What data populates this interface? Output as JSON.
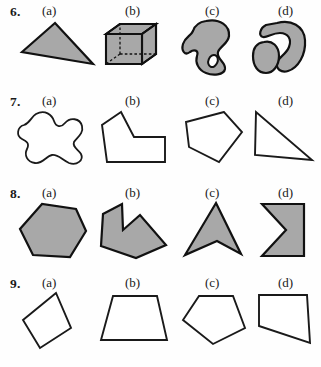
{
  "page": {
    "kind": "geometry-worksheet-figures",
    "background_color": "#fefefe",
    "fill_color": "#a8a8a8",
    "stroke_color": "#111111"
  },
  "option_labels": {
    "a": "(a)",
    "b": "(b)",
    "c": "(c)",
    "d": "(d)"
  },
  "questions": [
    {
      "number": "6.",
      "figures": [
        {
          "option": "(a)",
          "name": "shaded-obtuse-triangle",
          "style": "filled"
        },
        {
          "option": "(b)",
          "name": "wireframe-cube",
          "style": "filled-3d"
        },
        {
          "option": "(c)",
          "name": "shaded-blob-with-hole",
          "style": "filled"
        },
        {
          "option": "(d)",
          "name": "two-shaded-blobs",
          "style": "filled"
        }
      ]
    },
    {
      "number": "7.",
      "figures": [
        {
          "option": "(a)",
          "name": "curvy-closed-blob-outline",
          "style": "outline"
        },
        {
          "option": "(b)",
          "name": "l-shaped-polygon-outline",
          "style": "outline"
        },
        {
          "option": "(c)",
          "name": "pentagon-outline",
          "style": "outline"
        },
        {
          "option": "(d)",
          "name": "right-triangle-outline",
          "style": "outline"
        }
      ]
    },
    {
      "number": "8.",
      "figures": [
        {
          "option": "(a)",
          "name": "shaded-hexagon",
          "style": "filled"
        },
        {
          "option": "(b)",
          "name": "shaded-concave-arrow-polygon",
          "style": "filled"
        },
        {
          "option": "(c)",
          "name": "shaded-arrowhead-polygon",
          "style": "filled"
        },
        {
          "option": "(d)",
          "name": "shaded-chevron-notch-polygon",
          "style": "filled"
        }
      ]
    },
    {
      "number": "9.",
      "figures": [
        {
          "option": "(a)",
          "name": "tilted-quadrilateral-outline",
          "style": "outline"
        },
        {
          "option": "(b)",
          "name": "trapezoid-outline",
          "style": "outline"
        },
        {
          "option": "(c)",
          "name": "pentagon-outline",
          "style": "outline"
        },
        {
          "option": "(d)",
          "name": "right-trapezoid-outline",
          "style": "outline"
        }
      ]
    }
  ]
}
